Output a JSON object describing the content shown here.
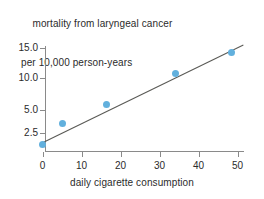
{
  "chart_data": {
    "type": "scatter",
    "title": "mortality from laryngeal cancer per 10,000 person-years",
    "title_line1": "mortality from laryngeal cancer",
    "title_line2": "per 10,000 person-years",
    "xlabel": "daily cigarette consumption",
    "ylabel": "",
    "xticks": [
      0,
      10,
      20,
      30,
      40,
      50
    ],
    "xtick_labels": [
      "0",
      "10",
      "20",
      "30",
      "40",
      "50"
    ],
    "yticks": [
      2.5,
      5.0,
      10.0,
      15.0
    ],
    "ytick_labels": [
      "2.5",
      "5.0",
      "10.0",
      "15.0"
    ],
    "xlim": [
      -1,
      51
    ],
    "ylim": [
      0,
      16
    ],
    "grid": false,
    "legend": null,
    "y_scale_note": "non-linear (square-root style) vertical scale",
    "x": [
      0,
      5,
      16.5,
      34,
      48.5
    ],
    "y": [
      0.9,
      3.5,
      5.8,
      10.8,
      14.2
    ],
    "points": [
      {
        "x": 0,
        "y": 0.9
      },
      {
        "x": 5,
        "y": 3.5
      },
      {
        "x": 16.5,
        "y": 5.8
      },
      {
        "x": 34,
        "y": 10.8
      },
      {
        "x": 48.5,
        "y": 14.2
      }
    ],
    "trend_line": {
      "label": "fitted regression line",
      "x_start": 0,
      "y_start": 1.1,
      "x_end": 51.5,
      "y_end": 15.5
    },
    "colors": {
      "marker": "#62b0dd",
      "trend_line": "#5a5a56",
      "axis": "#8a8a8a",
      "text": "#2b2b2b",
      "background": "#ffffff"
    }
  }
}
